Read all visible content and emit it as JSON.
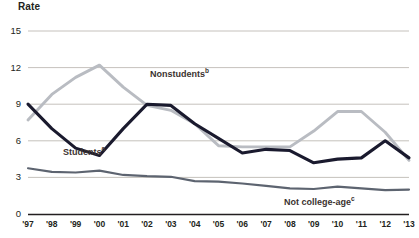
{
  "chart_data": {
    "type": "line",
    "title": "",
    "ylabel": "Rate",
    "xlabel": "",
    "ylim": [
      0,
      15
    ],
    "yticks": [
      0,
      3,
      6,
      9,
      12,
      15
    ],
    "grid": true,
    "legend_position": "inline-annotations",
    "categories": [
      "'97",
      "'98",
      "'99",
      "'00",
      "'01",
      "'02",
      "'03",
      "'04",
      "'05",
      "'06",
      "'07",
      "'08",
      "'09",
      "'10",
      "'11",
      "'12",
      "'13"
    ],
    "series": [
      {
        "name": "Students",
        "annotation": "Students",
        "annotation_superscript": "a",
        "color": "#1a1a2e",
        "values": [
          9.0,
          7.0,
          5.4,
          4.8,
          7.0,
          9.0,
          8.9,
          7.4,
          6.2,
          5.0,
          5.3,
          5.2,
          4.2,
          4.5,
          4.6,
          6.0,
          4.6
        ]
      },
      {
        "name": "Nonstudents",
        "annotation": "Nonstudents",
        "annotation_superscript": "b",
        "color": "#b9bcc2",
        "values": [
          7.7,
          9.8,
          11.2,
          12.2,
          10.4,
          8.9,
          8.5,
          7.4,
          5.6,
          5.5,
          5.5,
          5.5,
          6.8,
          8.4,
          8.4,
          6.7,
          4.4
        ]
      },
      {
        "name": "Not college-age",
        "annotation": "Not college-age",
        "annotation_superscript": "c",
        "color": "#5d6470",
        "values": [
          3.75,
          3.45,
          3.4,
          3.55,
          3.2,
          3.1,
          3.05,
          2.7,
          2.65,
          2.5,
          2.3,
          2.1,
          2.05,
          2.25,
          2.1,
          1.95,
          2.0
        ]
      }
    ]
  },
  "annotations": {
    "nonstudents": {
      "text": "Nonstudents",
      "sup": "b"
    },
    "students": {
      "text": "Students",
      "sup": "a"
    },
    "not_college_age": {
      "text": "Not college-age",
      "sup": "c"
    }
  }
}
